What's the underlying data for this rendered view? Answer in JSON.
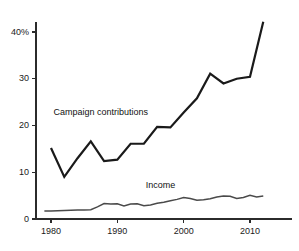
{
  "chart_data": {
    "type": "line",
    "title": "",
    "subtitle": "",
    "xlabel": "",
    "ylabel": "",
    "xlim": [
      1979,
      2012.5
    ],
    "ylim": [
      0,
      43
    ],
    "grid": false,
    "legend_position": "inline-annotations",
    "yticks": [
      0,
      10,
      20,
      30,
      40
    ],
    "ytick_labels": [
      "0",
      "10",
      "20",
      "30",
      "40%"
    ],
    "xticks": [
      1980,
      1990,
      2000,
      2010
    ],
    "xtick_labels": [
      "1980",
      "1990",
      "2000",
      "2010"
    ],
    "series": [
      {
        "name": "Campaign contributions",
        "color": "#1a1a1a",
        "width": 2.2,
        "label_x": 1987.5,
        "label_y": 22.8,
        "x": [
          1980,
          1982,
          1984,
          1986,
          1988,
          1990,
          1992,
          1994,
          1996,
          1998,
          2000,
          2002,
          2004,
          2006,
          2008,
          2010,
          2012
        ],
        "values": [
          15.2,
          9.0,
          13.0,
          16.6,
          12.4,
          12.7,
          16.1,
          16.1,
          19.7,
          19.6,
          22.8,
          25.8,
          31.1,
          29.0,
          30.0,
          30.4,
          42.2
        ]
      },
      {
        "name": "Income",
        "color": "#4a4a4a",
        "width": 1.5,
        "label_x": 1996.5,
        "label_y": 7.2,
        "x": [
          1979,
          1980,
          1981,
          1982,
          1983,
          1984,
          1985,
          1986,
          1987,
          1988,
          1989,
          1990,
          1991,
          1992,
          1993,
          1994,
          1995,
          1996,
          1997,
          1998,
          1999,
          2000,
          2001,
          2002,
          2003,
          2004,
          2005,
          2006,
          2007,
          2008,
          2009,
          2010,
          2011,
          2012
        ],
        "values": [
          1.7,
          1.7,
          1.75,
          1.8,
          1.85,
          1.9,
          1.95,
          2.0,
          2.6,
          3.3,
          3.2,
          3.25,
          2.8,
          3.2,
          3.25,
          2.85,
          3.0,
          3.35,
          3.6,
          3.9,
          4.2,
          4.6,
          4.4,
          4.0,
          4.1,
          4.35,
          4.7,
          4.9,
          4.85,
          4.4,
          4.6,
          5.05,
          4.7,
          4.9
        ]
      }
    ],
    "annotations": [
      {
        "text": "Campaign contributions"
      },
      {
        "text": "Income"
      }
    ]
  },
  "axis": {
    "line_color": "#2b2b2b",
    "tick_color": "#2b2b2b"
  }
}
